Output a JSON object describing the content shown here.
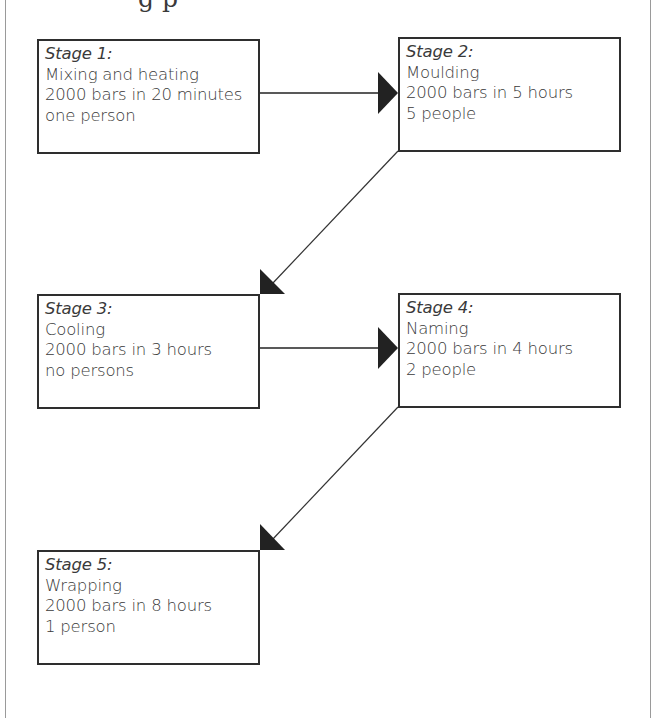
{
  "title_fragment": "g p",
  "colors": {
    "box_border": "#2e2e2e",
    "text": "#3a3a3a",
    "arrow": "#222222",
    "frame": "#9a9a9a"
  },
  "stages": [
    {
      "heading": "Stage 1:",
      "name": "Mixing and heating",
      "rate": "2000 bars in 20 minutes",
      "staff": "one person"
    },
    {
      "heading": "Stage 2:",
      "name": "Moulding",
      "rate": "2000 bars in 5 hours",
      "staff": "5 people"
    },
    {
      "heading": "Stage 3:",
      "name": "Cooling",
      "rate": "2000 bars in 3 hours",
      "staff": "no persons"
    },
    {
      "heading": "Stage 4:",
      "name": "Naming",
      "rate": "2000 bars in 4 hours",
      "staff": "2 people"
    },
    {
      "heading": "Stage 5:",
      "name": "Wrapping",
      "rate": "2000 bars in 8 hours",
      "staff": "1 person"
    }
  ],
  "connections": [
    {
      "from": "Stage 1",
      "to": "Stage 2",
      "direction": "horizontal"
    },
    {
      "from": "Stage 2",
      "to": "Stage 3",
      "direction": "diagonal"
    },
    {
      "from": "Stage 3",
      "to": "Stage 4",
      "direction": "horizontal"
    },
    {
      "from": "Stage 4",
      "to": "Stage 5",
      "direction": "diagonal"
    }
  ]
}
